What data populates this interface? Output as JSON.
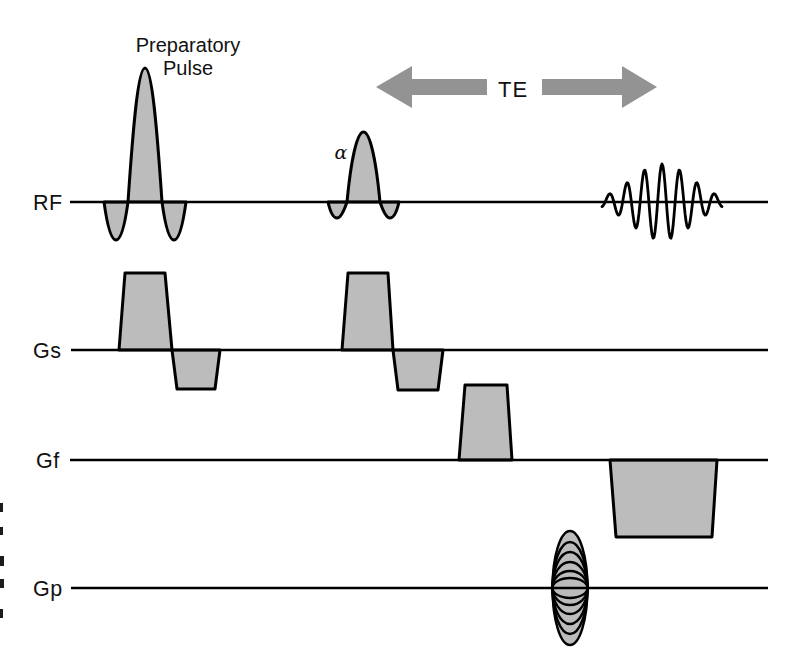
{
  "figure": {
    "background": "#ffffff",
    "rows": [
      {
        "id": "rf",
        "label": "RF"
      },
      {
        "id": "gs",
        "label": "Gs"
      },
      {
        "id": "gf",
        "label": "Gf"
      },
      {
        "id": "gp",
        "label": "Gp"
      }
    ],
    "annotations": {
      "preparatory_pulse": {
        "line1": "Preparatory",
        "line2": "Pulse"
      },
      "flip_angle": "α",
      "echo_time": "TE"
    },
    "colors": {
      "pulse_fill": "#bcbcbc",
      "arrow_fill": "#939393",
      "line": "#000000",
      "text": "#121212"
    },
    "echo": {
      "x_start": 602,
      "x_end": 722,
      "center_x": 662,
      "baseline_y": 202,
      "amplitude": 38,
      "period": 17.5,
      "envelope_sigma": 30
    }
  }
}
